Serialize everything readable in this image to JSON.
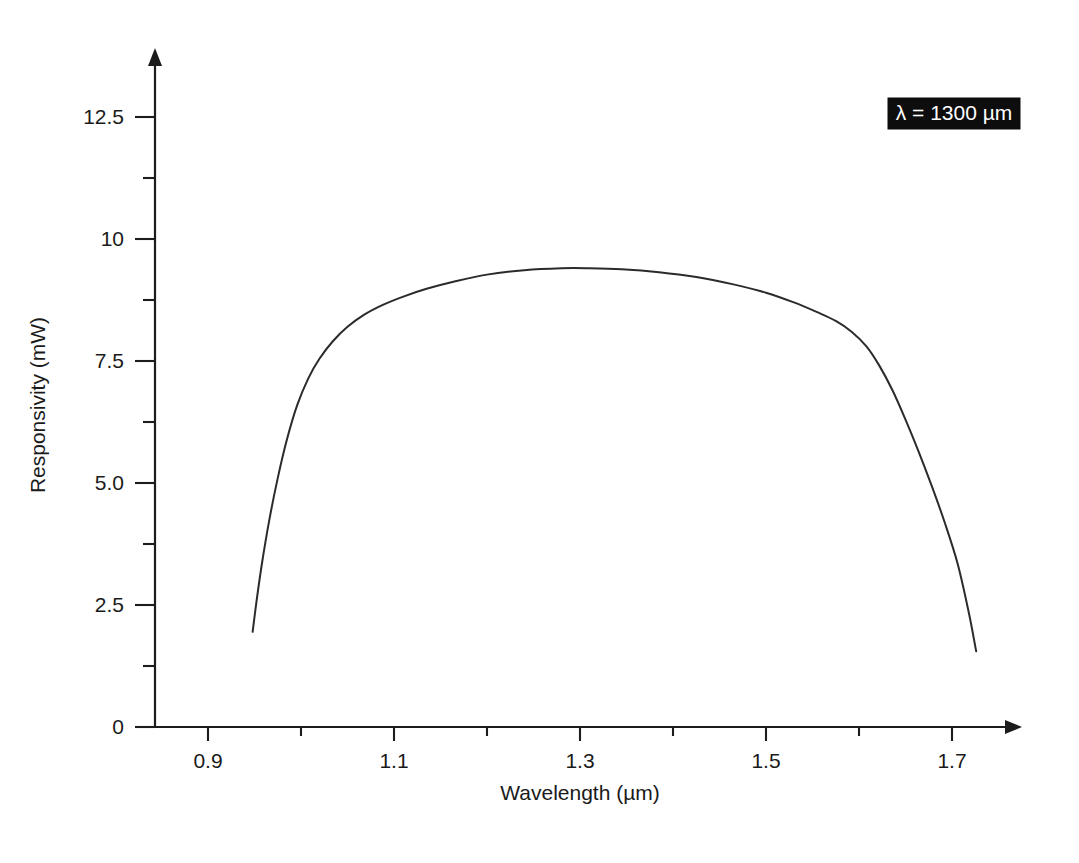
{
  "chart_data": {
    "type": "line",
    "title": "",
    "xlabel": "Wavelength (µm)",
    "ylabel": "Responsivity (mW)",
    "xlim": [
      0.855,
      1.79
    ],
    "ylim": [
      0,
      13.4
    ],
    "grid": false,
    "legend": "none",
    "x_ticks_major": [
      "0.9",
      "1.1",
      "1.3",
      "1.5",
      "1.7"
    ],
    "x_ticks_major_values": [
      0.9,
      1.1,
      1.3,
      1.5,
      1.7
    ],
    "x_ticks_minor_values": [
      1.0,
      1.2,
      1.4,
      1.6
    ],
    "y_ticks_major": [
      "0",
      "2.5",
      "5.0",
      "7.5",
      "10",
      "12.5"
    ],
    "y_ticks_major_values": [
      0,
      2.5,
      5.0,
      7.5,
      10,
      12.5
    ],
    "y_ticks_minor_values": [
      1.25,
      3.75,
      6.25,
      8.75,
      11.25
    ],
    "series": [
      {
        "name": "responsivity",
        "color": "#2b2b2b",
        "x": [
          0.948,
          0.952,
          0.958,
          0.966,
          0.975,
          0.985,
          0.996,
          1.008,
          1.02,
          1.034,
          1.05,
          1.068,
          1.088,
          1.11,
          1.135,
          1.165,
          1.2,
          1.24,
          1.28,
          1.31,
          1.345,
          1.385,
          1.425,
          1.465,
          1.5,
          1.53,
          1.555,
          1.575,
          1.592,
          1.608,
          1.622,
          1.636,
          1.65,
          1.664,
          1.678,
          1.692,
          1.706,
          1.718,
          1.726
        ],
        "y": [
          1.95,
          2.55,
          3.35,
          4.25,
          5.1,
          5.9,
          6.6,
          7.15,
          7.55,
          7.9,
          8.2,
          8.45,
          8.65,
          8.82,
          8.98,
          9.13,
          9.27,
          9.36,
          9.4,
          9.4,
          9.38,
          9.32,
          9.22,
          9.07,
          8.9,
          8.7,
          8.5,
          8.32,
          8.1,
          7.8,
          7.4,
          6.9,
          6.3,
          5.65,
          4.95,
          4.2,
          3.35,
          2.35,
          1.55
        ]
      }
    ],
    "annotations": [
      {
        "name": "wavelength-label",
        "text": "λ = 1300 µm",
        "style": "inverse-box",
        "background": "#0d0d0d",
        "text_color": "#ffffff",
        "x_px": 888,
        "y_px": 98,
        "w_px": 132,
        "h_px": 31
      }
    ]
  },
  "geometry": {
    "x_axis_y_px": 727,
    "y_axis_x_px": 155,
    "x_axis_start_px": 135,
    "x_axis_end_px": 1022,
    "y_axis_top_px": 48,
    "px_per_x_unit": 930,
    "px_per_y_unit": 48.8,
    "x_origin_value": 0.9,
    "x_origin_px": 208,
    "y_origin_value": 0,
    "y_origin_px": 727,
    "tick_major_len": 14,
    "tick_minor_len": 9
  },
  "labels": {
    "x_title": "Wavelength (µm)",
    "y_title": "Responsivity (mW)"
  }
}
